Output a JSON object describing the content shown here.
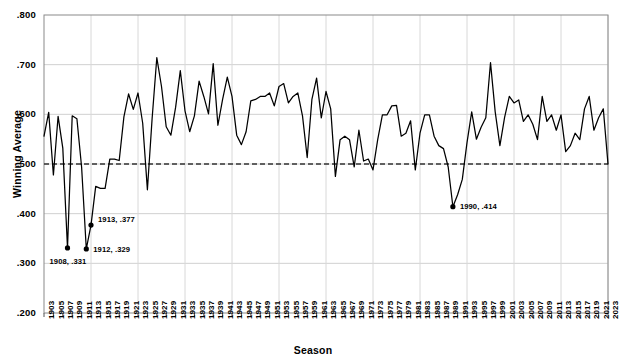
{
  "chart_data": {
    "type": "line",
    "title": "",
    "xlabel": "Season",
    "ylabel": "Winning Average",
    "ylim": [
      0.2,
      0.8
    ],
    "ytick_labels": [
      ".800",
      ".700",
      ".600",
      ".500",
      ".400",
      ".300",
      ".200"
    ],
    "ytick_values": [
      0.8,
      0.7,
      0.6,
      0.5,
      0.4,
      0.3,
      0.2
    ],
    "grid": true,
    "legend": "none",
    "reference_line": {
      "value": 0.5,
      "style": "dashed",
      "color": "#333333"
    },
    "line_color": "#000000",
    "xlim": [
      1903,
      2023
    ],
    "xtick_labels": [
      "1903",
      "1905",
      "1907",
      "1909",
      "1911",
      "1913",
      "1915",
      "1917",
      "1919",
      "1921",
      "1923",
      "1925",
      "1927",
      "1929",
      "1931",
      "1933",
      "1935",
      "1937",
      "1939",
      "1941",
      "1943",
      "1945",
      "1947",
      "1949",
      "1951",
      "1953",
      "1955",
      "1957",
      "1959",
      "1961",
      "1963",
      "1965",
      "1967",
      "1969",
      "1971",
      "1973",
      "1975",
      "1977",
      "1979",
      "1981",
      "1983",
      "1985",
      "1987",
      "1989",
      "1991",
      "1993",
      "1995",
      "1997",
      "1999",
      "2001",
      "2003",
      "2005",
      "2007",
      "2009",
      "2011",
      "2013",
      "2015",
      "2017",
      "2019",
      "2021",
      "2023"
    ],
    "x": [
      1903,
      1904,
      1905,
      1906,
      1907,
      1908,
      1909,
      1910,
      1911,
      1912,
      1913,
      1914,
      1915,
      1916,
      1917,
      1918,
      1919,
      1920,
      1921,
      1922,
      1923,
      1924,
      1925,
      1926,
      1927,
      1928,
      1929,
      1930,
      1931,
      1932,
      1933,
      1934,
      1935,
      1936,
      1937,
      1938,
      1939,
      1940,
      1941,
      1942,
      1943,
      1944,
      1945,
      1946,
      1947,
      1948,
      1949,
      1950,
      1951,
      1952,
      1953,
      1954,
      1955,
      1956,
      1957,
      1958,
      1959,
      1960,
      1961,
      1962,
      1963,
      1964,
      1965,
      1966,
      1967,
      1968,
      1969,
      1970,
      1971,
      1972,
      1973,
      1974,
      1975,
      1976,
      1977,
      1978,
      1979,
      1980,
      1981,
      1982,
      1983,
      1984,
      1985,
      1986,
      1987,
      1988,
      1989,
      1990,
      1991,
      1992,
      1993,
      1994,
      1995,
      1996,
      1997,
      1998,
      1999,
      2000,
      2001,
      2002,
      2003,
      2004,
      2005,
      2006,
      2007,
      2008,
      2009,
      2010,
      2011,
      2012,
      2013,
      2014,
      2015,
      2016,
      2017,
      2018,
      2019,
      2020,
      2021,
      2022,
      2023
    ],
    "values": [
      0.556,
      0.604,
      0.478,
      0.596,
      0.532,
      0.331,
      0.597,
      0.591,
      0.494,
      0.329,
      0.377,
      0.455,
      0.451,
      0.451,
      0.51,
      0.51,
      0.507,
      0.595,
      0.641,
      0.61,
      0.643,
      0.582,
      0.448,
      0.591,
      0.714,
      0.656,
      0.575,
      0.558,
      0.614,
      0.688,
      0.607,
      0.565,
      0.597,
      0.667,
      0.636,
      0.601,
      0.702,
      0.578,
      0.63,
      0.675,
      0.636,
      0.558,
      0.539,
      0.565,
      0.627,
      0.63,
      0.636,
      0.636,
      0.643,
      0.617,
      0.656,
      0.662,
      0.623,
      0.636,
      0.643,
      0.597,
      0.513,
      0.63,
      0.673,
      0.593,
      0.646,
      0.611,
      0.475,
      0.549,
      0.556,
      0.549,
      0.494,
      0.568,
      0.506,
      0.51,
      0.488,
      0.549,
      0.599,
      0.599,
      0.617,
      0.618,
      0.556,
      0.562,
      0.587,
      0.488,
      0.562,
      0.599,
      0.599,
      0.556,
      0.537,
      0.531,
      0.494,
      0.414,
      0.438,
      0.469,
      0.543,
      0.605,
      0.55,
      0.574,
      0.593,
      0.704,
      0.605,
      0.537,
      0.594,
      0.636,
      0.623,
      0.629,
      0.586,
      0.599,
      0.58,
      0.549,
      0.636,
      0.586,
      0.599,
      0.568,
      0.599,
      0.525,
      0.537,
      0.562,
      0.549,
      0.611,
      0.636,
      0.568,
      0.593,
      0.611,
      0.5
    ],
    "annotations": [
      {
        "label": "1908, .331",
        "x": 1908,
        "y": 0.331,
        "marker": true
      },
      {
        "label": "1912, .329",
        "x": 1912,
        "y": 0.329,
        "marker": true
      },
      {
        "label": "1913, .377",
        "x": 1913,
        "y": 0.377,
        "marker": true
      },
      {
        "label": "1990, .414",
        "x": 1990,
        "y": 0.414,
        "marker": true
      }
    ]
  }
}
